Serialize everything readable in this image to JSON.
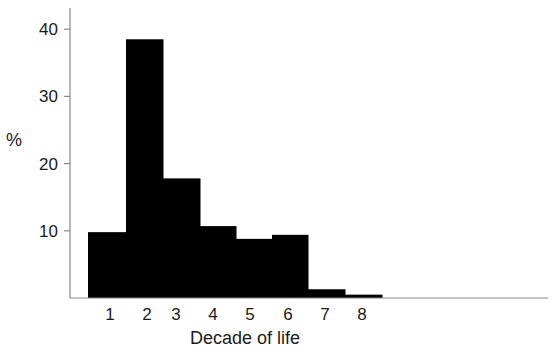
{
  "chart_data": {
    "type": "bar",
    "title": "",
    "xlabel": "Decade of life",
    "ylabel": "%",
    "categories": [
      "1",
      "2",
      "3",
      "4",
      "5",
      "6",
      "7",
      "8"
    ],
    "values": [
      9.8,
      38.5,
      17.8,
      10.7,
      8.8,
      9.4,
      1.3,
      0.5
    ],
    "yticks": [
      10,
      20,
      30,
      40
    ],
    "ylim": [
      0,
      44
    ],
    "grid": false,
    "legend": null,
    "bar_color": "#000000",
    "histogram": true
  }
}
